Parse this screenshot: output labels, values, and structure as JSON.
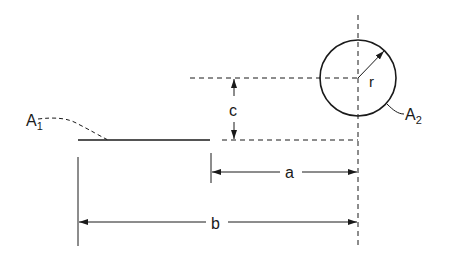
{
  "diagram": {
    "stroke_color": "#1a1a1a",
    "background": "#ffffff",
    "labels": {
      "A1_main": "A",
      "A1_sub": "1",
      "A2_main": "A",
      "A2_sub": "2",
      "radius": "r",
      "vertical_offset": "c",
      "distance_a": "a",
      "distance_b": "b"
    },
    "elements": {
      "line_A1": {
        "x1": 78,
        "y1": 140,
        "x2": 210,
        "y2": 140
      },
      "circle_A2": {
        "cx": 358,
        "cy": 78,
        "r": 38
      },
      "centerline_vertical": {
        "x": 358,
        "y1": 15,
        "y2": 248
      },
      "centerline_horizontal_upper": {
        "y": 78,
        "x1": 190,
        "x2": 358
      },
      "dashed_lower": {
        "y": 140,
        "x1": 222,
        "x2": 358
      },
      "dimension_c": {
        "x": 234,
        "y1": 78,
        "y2": 140
      },
      "dimension_a": {
        "y": 172,
        "x1": 211,
        "x2": 358
      },
      "dimension_b": {
        "y": 222,
        "x1": 78,
        "x2": 358
      }
    }
  }
}
